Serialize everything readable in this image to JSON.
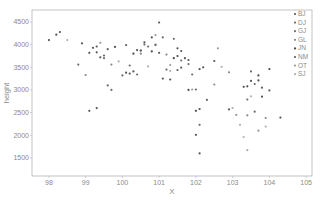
{
  "chart_data": {
    "type": "scatter",
    "title": "",
    "xlabel": "X",
    "ylabel": "height",
    "xlim": [
      97.54,
      105.16
    ],
    "ylim": [
      1100,
      4765
    ],
    "grid": false,
    "legend_position": "upper right, inside",
    "x_ticks": [
      98,
      99,
      100,
      101,
      102,
      103,
      104,
      105
    ],
    "y_ticks": [
      1500,
      2000,
      2500,
      3000,
      3500,
      4000,
      4500
    ],
    "series": [
      {
        "name": "BJ",
        "color": "#555555",
        "points": [
          [
            98.0,
            4100
          ],
          [
            98.2,
            4220
          ],
          [
            98.3,
            4280
          ],
          [
            98.9,
            4030
          ],
          [
            99.2,
            3930
          ],
          [
            99.3,
            3960
          ],
          [
            99.1,
            3820
          ],
          [
            99.3,
            3830
          ],
          [
            99.4,
            3720
          ],
          [
            99.8,
            3950
          ],
          [
            100.1,
            3380
          ],
          [
            100.2,
            3360
          ],
          [
            100.3,
            3410
          ],
          [
            100.4,
            3880
          ],
          [
            100.5,
            3870
          ],
          [
            100.6,
            4050
          ],
          [
            100.8,
            4160
          ],
          [
            101.0,
            4490
          ],
          [
            101.1,
            3250
          ],
          [
            101.3,
            3230
          ],
          [
            101.5,
            3920
          ],
          [
            101.6,
            3860
          ],
          [
            101.7,
            3700
          ],
          [
            101.8,
            3660
          ],
          [
            102.1,
            3460
          ],
          [
            102.2,
            3500
          ],
          [
            102.5,
            3640
          ],
          [
            103.3,
            3070
          ],
          [
            103.5,
            3200
          ],
          [
            103.7,
            3210
          ],
          [
            103.8,
            2850
          ],
          [
            104.3,
            2390
          ],
          [
            102.1,
            1600
          ],
          [
            102.0,
            2010
          ],
          [
            99.1,
            2540
          ],
          [
            99.3,
            2600
          ]
        ]
      },
      {
        "name": "DJ",
        "color": "#6a6a6a",
        "points": [
          [
            98.8,
            3560
          ],
          [
            99.5,
            3760
          ],
          [
            99.6,
            3100
          ],
          [
            100.0,
            3320
          ],
          [
            100.2,
            3540
          ],
          [
            100.7,
            3960
          ],
          [
            100.9,
            3990
          ],
          [
            101.2,
            3450
          ],
          [
            101.9,
            3340
          ],
          [
            102.0,
            3010
          ],
          [
            102.3,
            2780
          ],
          [
            103.4,
            2790
          ],
          [
            103.6,
            2520
          ]
        ]
      },
      {
        "name": "GJ",
        "color": "#707070",
        "points": [
          [
            99.5,
            3700
          ],
          [
            99.7,
            3000
          ],
          [
            100.4,
            3340
          ],
          [
            100.6,
            4000
          ],
          [
            100.9,
            4000
          ],
          [
            101.1,
            4160
          ],
          [
            101.4,
            4130
          ],
          [
            101.6,
            3650
          ],
          [
            101.8,
            3570
          ],
          [
            102.1,
            2230
          ],
          [
            103.5,
            3410
          ],
          [
            103.6,
            3130
          ]
        ]
      },
      {
        "name": "GL",
        "color": "#888888",
        "points": [
          [
            99.0,
            3330
          ],
          [
            99.7,
            3560
          ],
          [
            100.5,
            3800
          ],
          [
            101.2,
            3780
          ],
          [
            102.5,
            3120
          ],
          [
            102.9,
            3390
          ],
          [
            103.4,
            2440
          ],
          [
            103.9,
            2380
          ]
        ]
      },
      {
        "name": "JN",
        "color": "#4a4a4a",
        "points": [
          [
            100.3,
            3800
          ],
          [
            100.8,
            3850
          ],
          [
            101.4,
            3700
          ],
          [
            101.5,
            3750
          ],
          [
            101.8,
            3000
          ],
          [
            102.0,
            2540
          ],
          [
            102.1,
            2580
          ],
          [
            103.4,
            3080
          ],
          [
            103.7,
            3320
          ],
          [
            104.0,
            3460
          ]
        ]
      },
      {
        "name": "NM",
        "color": "#5f5f5f",
        "points": [
          [
            99.6,
            3900
          ],
          [
            100.1,
            3990
          ],
          [
            100.5,
            3870
          ],
          [
            101.0,
            3820
          ],
          [
            101.5,
            3440
          ],
          [
            101.6,
            3490
          ],
          [
            102.9,
            2570
          ],
          [
            103.8,
            3050
          ],
          [
            104.0,
            2990
          ]
        ]
      },
      {
        "name": "OT",
        "color": "#9a9a9a",
        "points": [
          [
            99.4,
            4040
          ],
          [
            100.9,
            4210
          ],
          [
            101.3,
            3550
          ],
          [
            101.9,
            3010
          ],
          [
            102.6,
            3920
          ],
          [
            103.1,
            2450
          ],
          [
            103.7,
            2100
          ]
        ]
      },
      {
        "name": "SJ",
        "color": "#b0b0b0",
        "points": [
          [
            98.5,
            4100
          ],
          [
            99.9,
            3630
          ],
          [
            100.7,
            3520
          ],
          [
            101.3,
            3420
          ],
          [
            102.7,
            3510
          ],
          [
            103.0,
            2600
          ],
          [
            103.2,
            2230
          ],
          [
            103.3,
            1960
          ],
          [
            103.4,
            1670
          ],
          [
            103.5,
            2860
          ],
          [
            103.9,
            2190
          ]
        ]
      }
    ]
  }
}
